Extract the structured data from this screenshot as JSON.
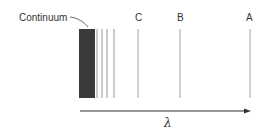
{
  "diagram": {
    "type": "spectral-series",
    "continuum_label": "Continuum",
    "continuum_block": {
      "x0": 79,
      "x1": 95,
      "color": "#3a3a3a"
    },
    "continuum_lines_x": [
      97,
      102,
      107,
      113
    ],
    "labeled_lines": [
      {
        "label": "C",
        "x": 138
      },
      {
        "label": "B",
        "x": 180
      },
      {
        "label": "A",
        "x": 250
      }
    ],
    "axis_label": "λ",
    "line_color": "#9a9a9a",
    "axis_color": "#333333"
  }
}
